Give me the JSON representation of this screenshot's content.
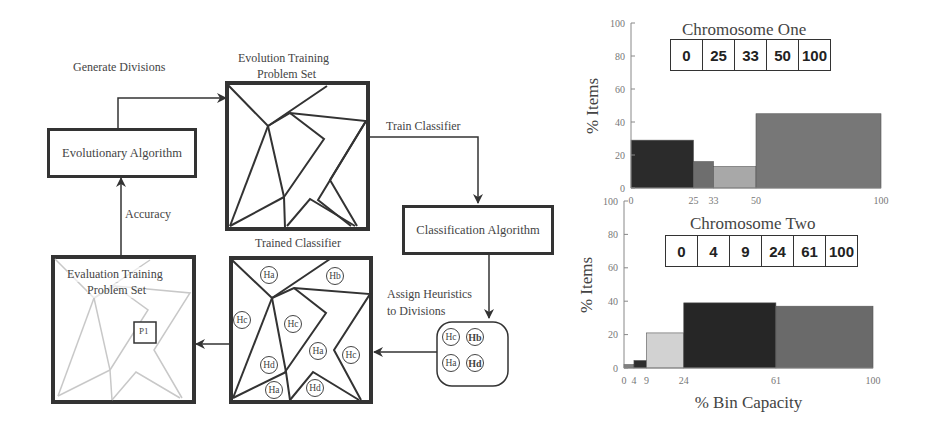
{
  "diagram": {
    "labels": {
      "generate_divisions": "Generate Divisions",
      "evolution_set_line1": "Evolution Training",
      "evolution_set_line2": "Problem Set",
      "train_classifier": "Train Classifier",
      "accuracy": "Accuracy",
      "trained_classifier": "Trained Classifier",
      "assign_line1": "Assign Heuristics",
      "assign_line2": "to Divisions",
      "evaluation_line1": "Evaluation Training",
      "evaluation_line2": "Problem  Set",
      "p1": "P1"
    },
    "boxes": {
      "evolutionary_algorithm": "Evolutionary Algorithm",
      "classification_algorithm": "Classification Algorithm"
    },
    "heuristics_legend": [
      "Hc",
      "Hb",
      "Ha",
      "Hd"
    ],
    "trained_regions": [
      {
        "label": "Ha",
        "x": 269,
        "y": 275
      },
      {
        "label": "Hb",
        "x": 335,
        "y": 276
      },
      {
        "label": "Hc",
        "x": 242,
        "y": 320
      },
      {
        "label": "Hc",
        "x": 293,
        "y": 324
      },
      {
        "label": "Ha",
        "x": 318,
        "y": 351
      },
      {
        "label": "Hc",
        "x": 351,
        "y": 355
      },
      {
        "label": "Hd",
        "x": 269,
        "y": 365
      },
      {
        "label": "Ha",
        "x": 274,
        "y": 390
      },
      {
        "label": "Hd",
        "x": 315,
        "y": 388
      }
    ]
  },
  "chart_data": [
    {
      "type": "bar",
      "title": "Chromosome One",
      "chromosome": [
        "0",
        "25",
        "33",
        "50",
        "100"
      ],
      "xlabel": "",
      "ylabel": "% Items",
      "ylim": [
        0,
        100
      ],
      "xlim": [
        0,
        100
      ],
      "yticks": [
        "0",
        "20",
        "40",
        "60",
        "80",
        "100"
      ],
      "xticks": [
        "0",
        "25",
        "33",
        "50",
        "100"
      ],
      "bins": [
        {
          "from": 0,
          "to": 25,
          "value": 29,
          "color": "#2b2b2b"
        },
        {
          "from": 25,
          "to": 33,
          "value": 16,
          "color": "#6e6e6e"
        },
        {
          "from": 33,
          "to": 50,
          "value": 13,
          "color": "#a8a8a8"
        },
        {
          "from": 50,
          "to": 100,
          "value": 45,
          "color": "#777777"
        }
      ]
    },
    {
      "type": "bar",
      "title": "Chromosome Two",
      "chromosome": [
        "0",
        "4",
        "9",
        "24",
        "61",
        "100"
      ],
      "xlabel": "% Bin Capacity",
      "ylabel": "% Items",
      "ylim": [
        0,
        100
      ],
      "xlim": [
        0,
        100
      ],
      "yticks": [
        "0",
        "20",
        "40",
        "60",
        "80",
        "100"
      ],
      "xticks": [
        "0",
        "4",
        "9",
        "24",
        "61",
        "100"
      ],
      "bins": [
        {
          "from": 0,
          "to": 4,
          "value": 2,
          "color": "#808080"
        },
        {
          "from": 4,
          "to": 9,
          "value": 4.5,
          "color": "#2e2e2e"
        },
        {
          "from": 9,
          "to": 24,
          "value": 21,
          "color": "#d2d2d2"
        },
        {
          "from": 24,
          "to": 61,
          "value": 39,
          "color": "#262626"
        },
        {
          "from": 61,
          "to": 100,
          "value": 37,
          "color": "#6a6a6a"
        }
      ]
    }
  ]
}
